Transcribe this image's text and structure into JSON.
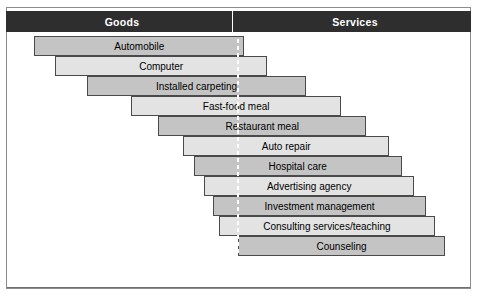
{
  "header": {
    "left_label": "Goods",
    "right_label": "Services",
    "band_color": "#2e2e2e",
    "text_color": "#ffffff"
  },
  "axis": {
    "center_label": "0",
    "left_ticks": [
      "100%",
      "75",
      "50",
      "25"
    ],
    "right_ticks": [
      "25",
      "50",
      "75",
      "100%"
    ],
    "all_tick_labels": [
      "100%",
      "75",
      "50",
      "25",
      "0",
      "25",
      "50",
      "75",
      "100%"
    ],
    "tick_values": [
      -100,
      -75,
      -50,
      -25,
      0,
      25,
      50,
      75,
      100
    ]
  },
  "colors": {
    "bar_dark": "#c4c4c4",
    "bar_light": "#e3e3e3",
    "bar_border": "#4a4a4a",
    "frame": "#8d8d8d",
    "center_dash": "#ffffff"
  },
  "chart_data": {
    "type": "bar",
    "xlabel": "",
    "ylabel": "",
    "orientation": "horizontal-diverging",
    "xlim": [
      -100,
      100
    ],
    "grid": false,
    "legend": "none",
    "axis_note": "Left half measures percent Goods, right half measures percent Services; each bar spans from its goods share to its services share.",
    "categories": [
      "Automobile",
      "Computer",
      "Installed carpeting",
      "Fast-food meal",
      "Restaurant meal",
      "Auto repair",
      "Hospital care",
      "Advertising agency",
      "Investment management",
      "Consulting services/teaching",
      "Counseling"
    ],
    "series": [
      {
        "name": "Goods content (%)",
        "values": [
          97,
          87,
          72,
          51,
          38,
          26,
          21,
          16,
          12,
          9,
          0
        ]
      },
      {
        "name": "Services content (%)",
        "values": [
          3,
          14,
          33,
          50,
          62,
          73,
          79,
          85,
          91,
          95,
          100
        ]
      }
    ],
    "bars": [
      {
        "label": "Automobile",
        "goods": 97,
        "services": 3,
        "tone": "dark"
      },
      {
        "label": "Computer",
        "goods": 87,
        "services": 14,
        "tone": "light"
      },
      {
        "label": "Installed carpeting",
        "goods": 72,
        "services": 33,
        "tone": "dark"
      },
      {
        "label": "Fast-food meal",
        "goods": 51,
        "services": 50,
        "tone": "light"
      },
      {
        "label": "Restaurant meal",
        "goods": 38,
        "services": 62,
        "tone": "dark"
      },
      {
        "label": "Auto repair",
        "goods": 26,
        "services": 73,
        "tone": "light"
      },
      {
        "label": "Hospital care",
        "goods": 21,
        "services": 79,
        "tone": "dark"
      },
      {
        "label": "Advertising agency",
        "goods": 16,
        "services": 85,
        "tone": "light"
      },
      {
        "label": "Investment management",
        "goods": 12,
        "services": 91,
        "tone": "dark"
      },
      {
        "label": "Consulting services/teaching",
        "goods": 9,
        "services": 95,
        "tone": "light"
      },
      {
        "label": "Counseling",
        "goods": 0,
        "services": 100,
        "tone": "dark"
      }
    ]
  }
}
